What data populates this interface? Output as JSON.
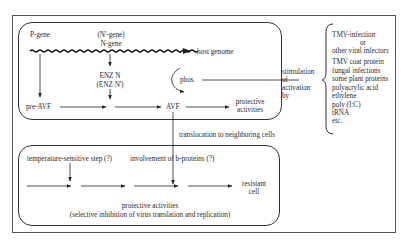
{
  "upper_box": {
    "p_gene": "P-gene",
    "n_prime_gene": "(N'-gene)",
    "n_gene": "N-gene",
    "host_genome": "host genome",
    "enz_n": "ENZ N",
    "enz_n_prime": "(ENZ N')",
    "phos": "phos.",
    "pre_avf": "pre-AVF",
    "avf": "AVF",
    "protective_1": "protective",
    "protective_2": "activities"
  },
  "stimulation": {
    "line1": "stimulation",
    "line2": "of",
    "line3": "activation",
    "line4": "by"
  },
  "inducers": {
    "items": [
      "TMV-infection",
      "or",
      "other viral infectors",
      "TMV coat protein",
      "fungal infections",
      "some plant proteins",
      "polyacrylic acid",
      "ethylene",
      "poly (I:C)",
      "tRNA",
      "etc."
    ]
  },
  "translocation": "translocation to neighboring cells",
  "lower_box": {
    "temp_step": "temperature-sensitive step (?)",
    "b_proteins": "involvement of b-proteins (?)",
    "resistant_1": "resistant",
    "resistant_2": "cell",
    "protective_1": "protective activities",
    "protective_2": "(selective inhibition of virus translation and replication)"
  }
}
